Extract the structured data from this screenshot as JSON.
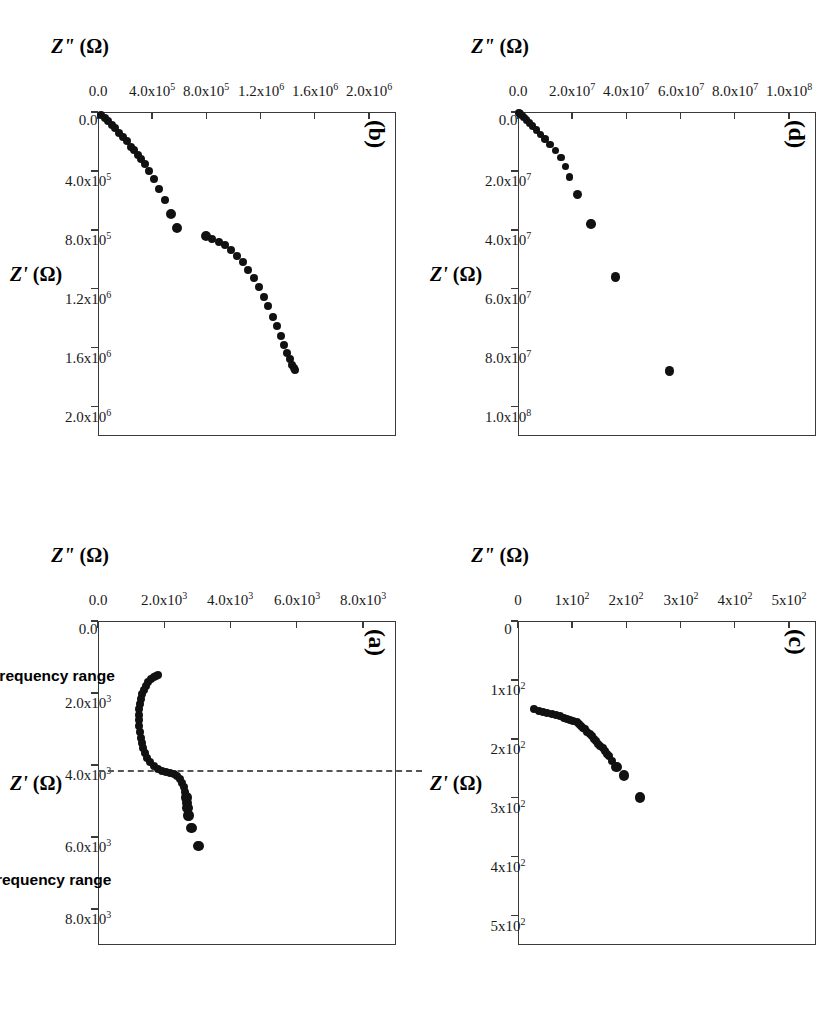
{
  "figure": {
    "rotation_deg": 90,
    "background": "#ffffff",
    "marker_color": "#111111",
    "axis_color": "#3a3a3a",
    "panels": [
      "a",
      "b",
      "c",
      "d"
    ]
  },
  "annotations": {
    "high_freq_label": "high frequency range",
    "low_freq_label": "low frequency range",
    "dashed_divider": true
  },
  "chart_data": [
    {
      "id": "a",
      "panel_label": "(a)",
      "type": "scatter",
      "title": "",
      "xlabel": "Z' (Ω)",
      "ylabel": "Z\" (Ω)",
      "xlim": [
        0,
        9000
      ],
      "ylim": [
        0,
        9000
      ],
      "xticks": [
        0,
        2000,
        4000,
        6000,
        8000
      ],
      "xticklabels": [
        "0.0",
        "2.0x10|3",
        "4.0x10|3",
        "6.0x10|3",
        "8.0x10|3"
      ],
      "yticks": [
        0,
        2000,
        4000,
        6000,
        8000
      ],
      "yticklabels": [
        "0.0",
        "2.0x10|3",
        "4.0x10|3",
        "6.0x10|3",
        "8.0x10|3"
      ],
      "grid": false,
      "annotation_line_x": 4200,
      "notes": "Semicircle arc from ~1500 to ~4200 ohm plus low-frequency spur tail",
      "x": [
        1500,
        1520,
        1560,
        1620,
        1700,
        1800,
        1910,
        2030,
        2160,
        2300,
        2450,
        2600,
        2760,
        2920,
        3080,
        3240,
        3390,
        3540,
        3680,
        3810,
        3930,
        4030,
        4110,
        4170,
        4205,
        4230,
        4260,
        4310,
        4390,
        4490,
        4620,
        4760,
        4900,
        5050,
        5200,
        5400,
        5750,
        6250
      ],
      "y": [
        1820,
        1760,
        1680,
        1600,
        1520,
        1450,
        1390,
        1340,
        1300,
        1270,
        1250,
        1240,
        1240,
        1245,
        1260,
        1285,
        1320,
        1365,
        1420,
        1490,
        1575,
        1680,
        1800,
        1930,
        2060,
        2180,
        2290,
        2390,
        2480,
        2550,
        2600,
        2640,
        2670,
        2690,
        2710,
        2740,
        2820,
        3030
      ]
    },
    {
      "id": "b",
      "panel_label": "(b)",
      "type": "scatter",
      "title": "",
      "xlabel": "Z' (Ω)",
      "ylabel": "Z\" (Ω)",
      "xlim": [
        0,
        2200000
      ],
      "ylim": [
        0,
        2200000
      ],
      "xticks": [
        0,
        400000,
        800000,
        1200000,
        1600000,
        2000000
      ],
      "xticklabels": [
        "0.0",
        "4.0x10|5",
        "8.0x10|5",
        "1.2x10|6",
        "1.6x10|6",
        "2.0x10|6"
      ],
      "yticks": [
        0,
        400000,
        800000,
        1200000,
        1600000,
        2000000
      ],
      "yticklabels": [
        "0.0",
        "4.0x10|5",
        "8.0x10|5",
        "1.2x10|6",
        "1.6x10|6",
        "2.0x10|6"
      ],
      "grid": false,
      "notes": "Dense cluster near origin then sparse points then a rising arc branch",
      "x": [
        20000,
        40000,
        60000,
        85000,
        110000,
        140000,
        170000,
        200000,
        235000,
        260000,
        290000,
        320000,
        355000,
        400000,
        455000,
        520000,
        600000,
        690000,
        790000,
        840000,
        860000,
        880000,
        905000,
        935000,
        975000,
        1020000,
        1070000,
        1130000,
        1190000,
        1255000,
        1320000,
        1390000,
        1455000,
        1520000,
        1580000,
        1635000,
        1680000,
        1715000,
        1740000,
        1755000
      ],
      "y": [
        25000,
        48000,
        72000,
        100000,
        128000,
        158000,
        188000,
        216000,
        246000,
        268000,
        292000,
        318000,
        345000,
        378000,
        415000,
        452000,
        495000,
        540000,
        580000,
        800000,
        845000,
        890000,
        935000,
        980000,
        1025000,
        1068000,
        1110000,
        1150000,
        1190000,
        1225000,
        1258000,
        1290000,
        1320000,
        1348000,
        1372000,
        1395000,
        1415000,
        1432000,
        1445000,
        1455000
      ]
    },
    {
      "id": "c",
      "panel_label": "(c)",
      "type": "scatter",
      "title": "",
      "xlabel": "Z' (Ω)",
      "ylabel": "Z\" (Ω)",
      "xlim": [
        0,
        550
      ],
      "ylim": [
        0,
        550
      ],
      "xticks": [
        0,
        100,
        200,
        300,
        400,
        500
      ],
      "xticklabels": [
        "0",
        "1x10|2",
        "2x10|2",
        "3x10|2",
        "4x10|2",
        "5x10|2"
      ],
      "yticks": [
        0,
        100,
        200,
        300,
        400,
        500
      ],
      "yticklabels": [
        "0",
        "1x10|2",
        "2x10|2",
        "3x10|2",
        "4x10|2",
        "5x10|2"
      ],
      "grid": false,
      "notes": "Near-vertical cluster at ~150-170 ohm then a straight 45-degree spur to ~300 ohm",
      "x": [
        150,
        152,
        154,
        156,
        158,
        160,
        162,
        164,
        166,
        168,
        170,
        172,
        175,
        178,
        181,
        184,
        188,
        192,
        196,
        200,
        204,
        208,
        212,
        216,
        220,
        225,
        230,
        238,
        248,
        262,
        300
      ],
      "y": [
        30,
        38,
        46,
        54,
        62,
        70,
        78,
        84,
        90,
        96,
        102,
        108,
        112,
        116,
        120,
        124,
        128,
        132,
        136,
        140,
        144,
        148,
        152,
        156,
        160,
        164,
        168,
        174,
        182,
        196,
        225
      ]
    },
    {
      "id": "d",
      "panel_label": "(d)",
      "type": "scatter",
      "title": "",
      "xlabel": "Z' (Ω)",
      "ylabel": "Z\" (Ω)",
      "xlim": [
        0,
        110000000
      ],
      "ylim": [
        0,
        110000000
      ],
      "xticks": [
        0,
        20000000,
        40000000,
        60000000,
        80000000,
        100000000
      ],
      "xticklabels": [
        "0.0",
        "2.0x10|7",
        "4.0x10|7",
        "6.0x10|7",
        "8.0x10|7",
        "1.0x10|8"
      ],
      "yticks": [
        0,
        20000000,
        40000000,
        60000000,
        80000000,
        100000000
      ],
      "yticklabels": [
        "0.0",
        "2.0x10|7",
        "4.0x10|7",
        "6.0x10|7",
        "8.0x10|7",
        "1.0x10|8"
      ],
      "grid": false,
      "notes": "Sparse rising points, most crowded near the origin",
      "x": [
        300000,
        700000,
        1200000,
        1900000,
        2700000,
        3700000,
        4800000,
        6100000,
        7600000,
        9200000,
        11000000,
        13000000,
        15500000,
        18500000,
        22000000,
        28000000,
        38000000,
        56000000,
        88000000
      ],
      "y": [
        400000,
        900000,
        1500000,
        2300000,
        3200000,
        4200000,
        5400000,
        6800000,
        8300000,
        10000000,
        11800000,
        13800000,
        15800000,
        17500000,
        19000000,
        22000000,
        27000000,
        36000000,
        56000000
      ]
    }
  ]
}
